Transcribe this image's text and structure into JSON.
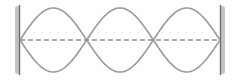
{
  "diagram": {
    "type": "standing-wave",
    "harmonic": 3,
    "loops": 3,
    "nodes_count": 4,
    "antinodes_count": 3,
    "ends": [
      "fixed",
      "fixed"
    ],
    "geometry": {
      "x_start": 20,
      "x_end": 220,
      "center_y": 40,
      "amplitude": 32
    },
    "colors": {
      "wave": "#9a9a9a",
      "axis": "#555555",
      "wall": "#6e6e6e",
      "wall_shade": "#b5b5b5",
      "background": "#ffffff"
    },
    "labels": {
      "title": "Standing wave, third harmonic"
    }
  }
}
